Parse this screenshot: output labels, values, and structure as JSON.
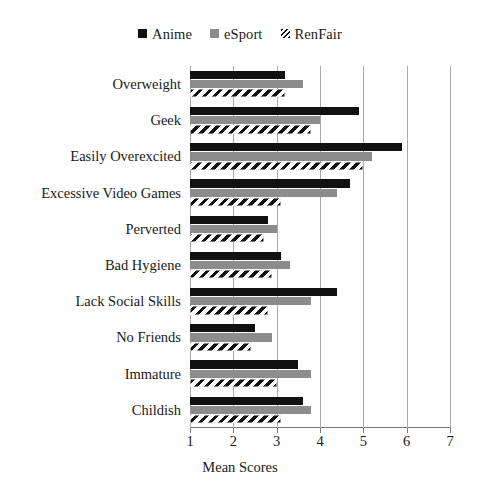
{
  "chart_data": {
    "type": "bar",
    "orientation": "horizontal",
    "title": "",
    "xlabel": "Mean Scores",
    "ylabel": "",
    "xlim": [
      1,
      7
    ],
    "xticks": [
      1,
      2,
      3,
      4,
      5,
      6,
      7
    ],
    "xtick_labels": [
      "1",
      "2",
      "3",
      "4",
      "5",
      "6",
      "7"
    ],
    "grid": true,
    "grid_axis": "x",
    "legend_position": "top-center",
    "categories": [
      "Overweight",
      "Geek",
      "Easily Overexcited",
      "Excessive Video Games",
      "Perverted",
      "Bad Hygiene",
      "Lack Social Skills",
      "No Friends",
      "Immature",
      "Childish"
    ],
    "series": [
      {
        "name": "Anime",
        "color": "#111111",
        "pattern": "solid",
        "values": [
          3.2,
          4.9,
          5.9,
          4.7,
          2.8,
          3.1,
          4.4,
          2.5,
          3.5,
          3.6
        ]
      },
      {
        "name": "eSport",
        "color": "#8c8c8c",
        "pattern": "solid",
        "values": [
          3.6,
          4.0,
          5.2,
          4.4,
          3.0,
          3.3,
          3.8,
          2.9,
          3.8,
          3.8
        ]
      },
      {
        "name": "RenFair",
        "color": "#111111",
        "pattern": "diagonal-hatch",
        "values": [
          3.2,
          3.8,
          5.0,
          3.1,
          2.7,
          2.9,
          2.8,
          2.4,
          3.0,
          3.1
        ]
      }
    ]
  },
  "legend": {
    "entries": [
      {
        "label": "Anime",
        "swatch": "solid-black"
      },
      {
        "label": "eSport",
        "swatch": "solid-gray"
      },
      {
        "label": "RenFair",
        "swatch": "hatched"
      }
    ]
  },
  "axis": {
    "x_title": "Mean Scores"
  }
}
